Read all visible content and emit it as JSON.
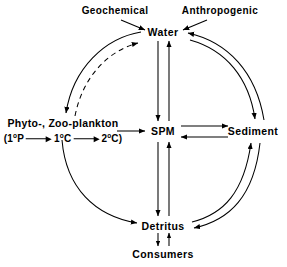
{
  "diagram": {
    "type": "cycle-flow-diagram",
    "background_color": "#ffffff",
    "line_color": "#000000",
    "nodes": {
      "geochemical": {
        "label": "Geochemical",
        "x": 115,
        "y": 11
      },
      "anthropogenic": {
        "label": "Anthropogenic",
        "x": 220,
        "y": 11
      },
      "water": {
        "label": "Water",
        "x": 163,
        "y": 32
      },
      "plankton_title": {
        "label": "Phyto-, Zoo-plankton",
        "x": 63,
        "y": 124
      },
      "spm": {
        "label": "SPM",
        "x": 163,
        "y": 131
      },
      "sediment": {
        "label": "Sediment",
        "x": 253,
        "y": 131
      },
      "detritus": {
        "label": "Detritus",
        "x": 163,
        "y": 226
      },
      "consumers": {
        "label": "Consumers",
        "x": 163,
        "y": 254
      }
    },
    "plankton_chain": {
      "open_paren": "(",
      "close_paren": ")",
      "steps": [
        {
          "value": "1",
          "sup": "o",
          "unit": "P"
        },
        {
          "value": "1",
          "sup": "o",
          "unit": "C"
        },
        {
          "value": "2",
          "sup": "o",
          "unit": "C"
        }
      ],
      "arrow_symbol": "arrow-right"
    },
    "edges": [
      {
        "from": "Geochemical",
        "to": "Water",
        "style": "solid",
        "shape": "diagonal",
        "direction": "one-way"
      },
      {
        "from": "Anthropogenic",
        "to": "Water",
        "style": "solid",
        "shape": "diagonal",
        "direction": "one-way"
      },
      {
        "from": "Water",
        "to": "Phyto-, Zoo-plankton",
        "style": "solid",
        "shape": "arc-left",
        "direction": "one-way"
      },
      {
        "from": "Phyto-, Zoo-plankton",
        "to": "Water",
        "style": "dashed",
        "shape": "arc-left",
        "direction": "one-way"
      },
      {
        "from": "Water",
        "to": "SPM",
        "style": "solid",
        "shape": "straight-vertical",
        "direction": "one-way"
      },
      {
        "from": "SPM",
        "to": "Water",
        "style": "solid",
        "shape": "straight-vertical",
        "direction": "one-way"
      },
      {
        "from": "Water",
        "to": "Sediment",
        "style": "solid",
        "shape": "arc-right",
        "direction": "one-way"
      },
      {
        "from": "Sediment",
        "to": "Water",
        "style": "solid",
        "shape": "arc-right",
        "direction": "one-way"
      },
      {
        "from": "Phyto-, Zoo-plankton",
        "to": "SPM",
        "style": "solid",
        "shape": "straight-horizontal",
        "direction": "one-way"
      },
      {
        "from": "SPM",
        "to": "Sediment",
        "style": "solid",
        "shape": "straight-horizontal",
        "direction": "one-way"
      },
      {
        "from": "Sediment",
        "to": "SPM",
        "style": "solid",
        "shape": "straight-horizontal",
        "direction": "one-way"
      },
      {
        "from": "Phyto-, Zoo-plankton",
        "to": "Detritus",
        "style": "solid",
        "shape": "arc-left",
        "direction": "one-way"
      },
      {
        "from": "SPM",
        "to": "Detritus",
        "style": "solid",
        "shape": "straight-vertical",
        "direction": "one-way"
      },
      {
        "from": "Detritus",
        "to": "SPM",
        "style": "solid",
        "shape": "straight-vertical",
        "direction": "one-way"
      },
      {
        "from": "Detritus",
        "to": "Sediment",
        "style": "solid",
        "shape": "arc-right",
        "direction": "one-way"
      },
      {
        "from": "Sediment",
        "to": "Detritus",
        "style": "solid",
        "shape": "arc-right",
        "direction": "one-way"
      },
      {
        "from": "Detritus",
        "to": "Consumers",
        "style": "solid",
        "shape": "straight-vertical",
        "direction": "one-way"
      },
      {
        "from": "Consumers",
        "to": "Detritus",
        "style": "solid",
        "shape": "straight-vertical",
        "direction": "one-way"
      }
    ]
  }
}
